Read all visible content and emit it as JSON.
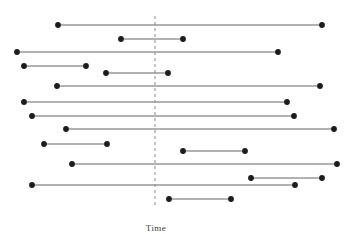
{
  "chart_data": {
    "type": "line",
    "title": "",
    "subtitle": "",
    "xlabel": "Time",
    "ylabel": "",
    "grid": false,
    "legend": null,
    "orientation": "horizontal",
    "axis_ranges": {
      "x_pixels": [
        0,
        354
      ],
      "y_pixels": [
        0,
        234
      ]
    },
    "reference_line": {
      "name": "vertical-reference",
      "orientation": "vertical",
      "x": 155,
      "y_start": 16,
      "y_end": 208,
      "style": "dashed",
      "color": "#8a8a8a",
      "width": 1,
      "dash": "3,3"
    },
    "marker": {
      "shape": "circle",
      "radius": 2.9,
      "color": "#1c1c1c"
    },
    "line_style": {
      "color": "#54545a",
      "width": 0.9
    },
    "segments": [
      {
        "id": 1,
        "label": "row-1",
        "y": 25,
        "x_start": 58,
        "x_end": 322
      },
      {
        "id": 2,
        "label": "row-2",
        "y": 39,
        "x_start": 121,
        "x_end": 183
      },
      {
        "id": 3,
        "label": "row-3",
        "y": 52,
        "x_start": 17,
        "x_end": 278
      },
      {
        "id": 4,
        "label": "row-4",
        "y": 66,
        "x_start": 24,
        "x_end": 86
      },
      {
        "id": 5,
        "label": "row-5",
        "y": 73,
        "x_start": 106,
        "x_end": 168
      },
      {
        "id": 6,
        "label": "row-6",
        "y": 86,
        "x_start": 57,
        "x_end": 320
      },
      {
        "id": 7,
        "label": "row-7",
        "y": 102,
        "x_start": 24,
        "x_end": 287
      },
      {
        "id": 8,
        "label": "row-8",
        "y": 116,
        "x_start": 32,
        "x_end": 294
      },
      {
        "id": 9,
        "label": "row-9",
        "y": 129,
        "x_start": 66,
        "x_end": 334
      },
      {
        "id": 10,
        "label": "row-10",
        "y": 144,
        "x_start": 44,
        "x_end": 107
      },
      {
        "id": 11,
        "label": "row-11",
        "y": 151,
        "x_start": 183,
        "x_end": 245
      },
      {
        "id": 12,
        "label": "row-12",
        "y": 164,
        "x_start": 72,
        "x_end": 337
      },
      {
        "id": 13,
        "label": "row-13",
        "y": 178,
        "x_start": 251,
        "x_end": 322
      },
      {
        "id": 14,
        "label": "row-14",
        "y": 185,
        "x_start": 32,
        "x_end": 295
      },
      {
        "id": 15,
        "label": "row-15",
        "y": 199,
        "x_start": 169,
        "x_end": 231
      }
    ],
    "x_label_position": {
      "x": 156,
      "y": 223
    }
  },
  "colors": {
    "background": "#ffffff",
    "marker": "#1c1c1c",
    "line": "#54545a",
    "reference_line": "#8a8a8a",
    "label_text": "#3c3c3c"
  }
}
